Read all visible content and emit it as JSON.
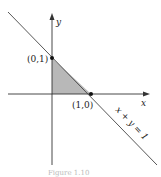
{
  "diagram": {
    "axis_x_label": "x",
    "axis_y_label": "y",
    "point_a_label": "(0,1)",
    "point_b_label": "(1,0)",
    "line_label": "x + y = 1",
    "caption": "Figure 1.10",
    "colors": {
      "axes": "#333333",
      "shade": "#b3b3b3",
      "line": "#444444",
      "points": "#111111"
    }
  }
}
